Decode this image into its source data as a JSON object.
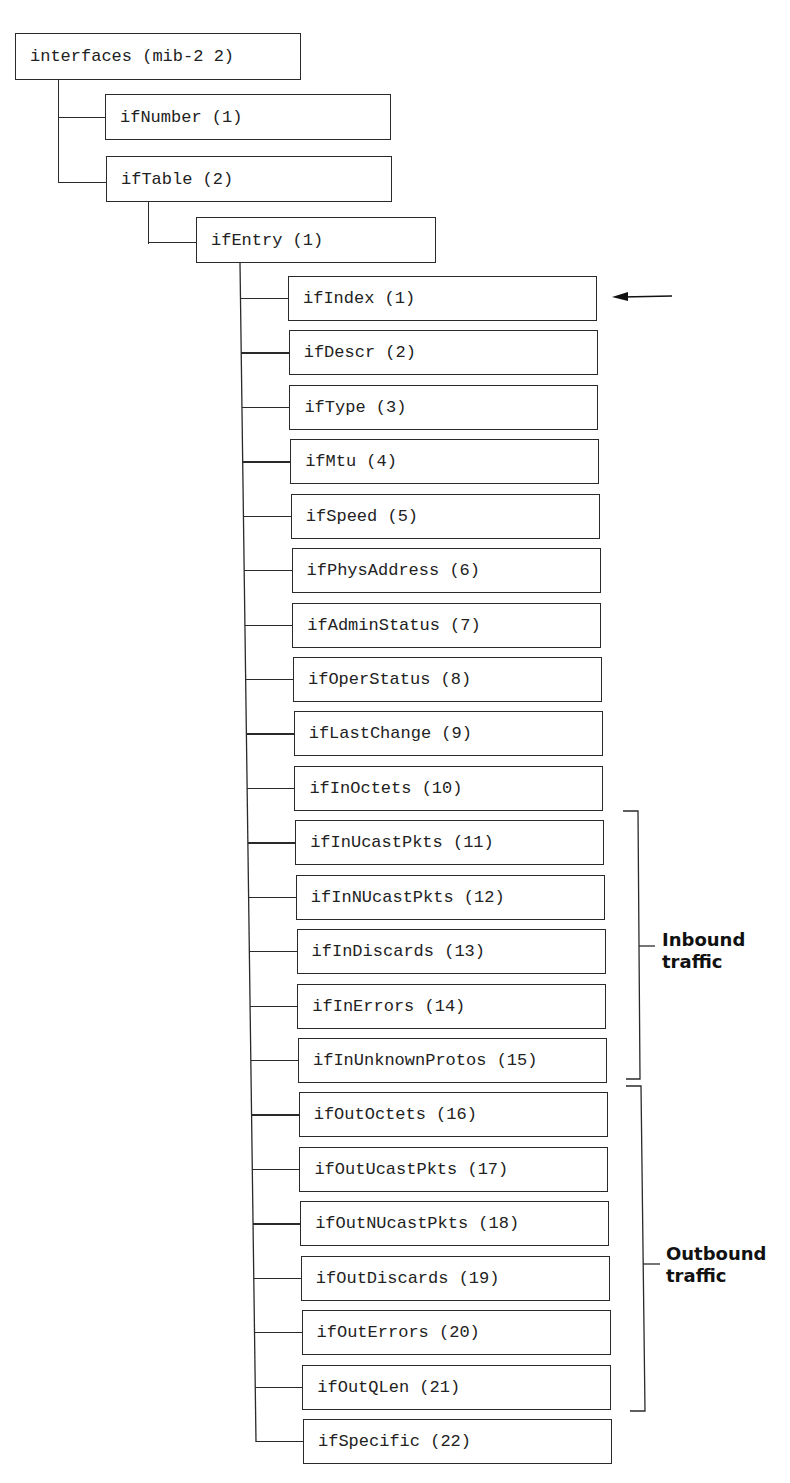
{
  "root": {
    "label": "interfaces (mib-2 2)"
  },
  "level1": [
    {
      "label": "ifNumber (1)"
    },
    {
      "label": "ifTable (2)"
    }
  ],
  "level2": {
    "label": "ifEntry (1)"
  },
  "entries": [
    {
      "label": "ifIndex (1)"
    },
    {
      "label": "ifDescr (2)"
    },
    {
      "label": "ifType (3)"
    },
    {
      "label": "ifMtu (4)"
    },
    {
      "label": "ifSpeed (5)"
    },
    {
      "label": "ifPhysAddress (6)"
    },
    {
      "label": "ifAdminStatus (7)"
    },
    {
      "label": "ifOperStatus (8)"
    },
    {
      "label": "ifLastChange (9)"
    },
    {
      "label": "ifInOctets (10)"
    },
    {
      "label": "ifInUcastPkts (11)"
    },
    {
      "label": "ifInNUcastPkts (12)"
    },
    {
      "label": "ifInDiscards (13)"
    },
    {
      "label": "ifInErrors (14)"
    },
    {
      "label": "ifInUnknownProtos (15)"
    },
    {
      "label": "ifOutOctets (16)"
    },
    {
      "label": "ifOutUcastPkts (17)"
    },
    {
      "label": "ifOutNUcastPkts (18)"
    },
    {
      "label": "ifOutDiscards (19)"
    },
    {
      "label": "ifOutErrors (20)"
    },
    {
      "label": "ifOutQLen (21)"
    },
    {
      "label": "ifSpecific (22)"
    }
  ],
  "annotations": {
    "arrow_target": "ifIndex (1)",
    "inbound": {
      "line1": "Inbound",
      "line2": "traffic",
      "range": "11-15"
    },
    "outbound": {
      "line1": "Outbound",
      "line2": "traffic",
      "range": "16-21"
    }
  }
}
